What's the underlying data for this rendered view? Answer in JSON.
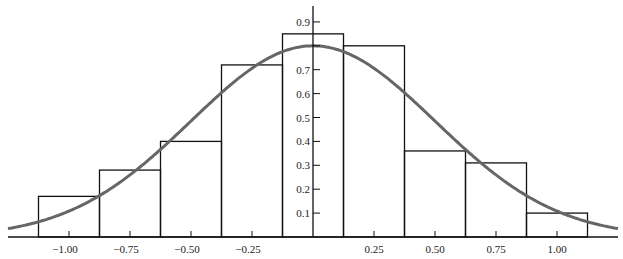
{
  "chart_data": {
    "type": "bar",
    "subtype": "histogram_with_density_curve",
    "title": "",
    "xlabel": "",
    "ylabel": "",
    "xlim": [
      -1.25,
      1.25
    ],
    "ylim": [
      0,
      0.95
    ],
    "grid": false,
    "legend": null,
    "x_ticks": [
      -1.0,
      -0.75,
      -0.5,
      -0.25,
      0.25,
      0.5,
      0.75,
      1.0
    ],
    "x_tick_labels": [
      "−1.00",
      "−0.75",
      "−0.50",
      "−0.25",
      "0.25",
      "0.50",
      "0.75",
      "1.00"
    ],
    "y_ticks": [
      0.1,
      0.2,
      0.3,
      0.4,
      0.5,
      0.6,
      0.7,
      0.8,
      0.9
    ],
    "y_tick_labels": [
      "0.1",
      "0.2",
      "0.3",
      "0.4",
      "0.5",
      "0.6",
      "0.7",
      "",
      "0.9"
    ],
    "bin_edges": [
      -1.125,
      -0.875,
      -0.625,
      -0.375,
      -0.125,
      0.125,
      0.375,
      0.625,
      0.875,
      1.125
    ],
    "categories": [
      "[-1.125,-0.875)",
      "[-0.875,-0.625)",
      "[-0.625,-0.375)",
      "[-0.375,-0.125)",
      "[-0.125,0.125)",
      "[0.125,0.375)",
      "[0.375,0.625)",
      "[0.625,0.875)",
      "[0.875,1.125)"
    ],
    "values": [
      0.17,
      0.28,
      0.4,
      0.72,
      0.85,
      0.8,
      0.36,
      0.31,
      0.1
    ],
    "series": [
      {
        "name": "histogram",
        "type": "bar",
        "values": [
          0.17,
          0.28,
          0.4,
          0.72,
          0.85,
          0.8,
          0.36,
          0.31,
          0.1
        ]
      },
      {
        "name": "normal density curve",
        "type": "line",
        "mean": 0.0,
        "sd": 0.5,
        "peak": 0.8,
        "color": "#666666"
      }
    ]
  },
  "colors": {
    "bar_stroke": "#111111",
    "curve": "#666666",
    "axis": "#111111"
  }
}
